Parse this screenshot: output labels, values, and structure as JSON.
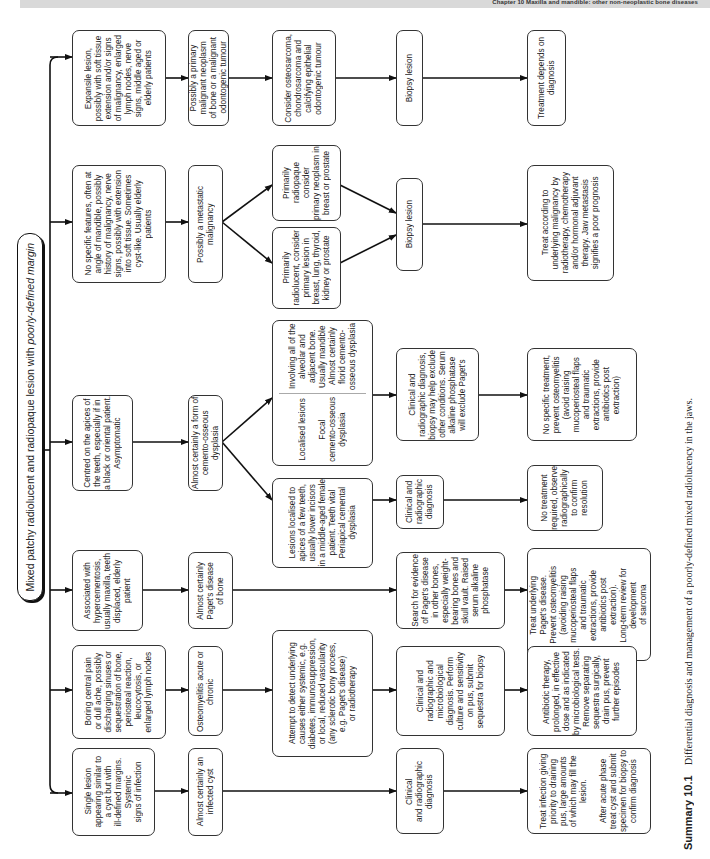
{
  "header": {
    "running_title": "Chapter 10 Maxilla and mandible: other non-neoplastic bone diseases"
  },
  "root": {
    "label_plain": "Mixed patchy radiolucent and radiopaque lesion with ",
    "label_italic": "poorly-defined margin"
  },
  "columns": [
    {
      "presentation": "Single lesion\nappearing similar to\na cyst but with\nill-defined margins.\nSystemic\nsigns of infection",
      "diagnosis": "Almost certainly an\ninfected cyst",
      "investigation": "Clinical\nand radiographic\ndiagnosis",
      "management": "Treat infection giving\npriority to draining\npus, large amounts\nof which may fill the\nlesion.\n\nAfter acute phase\ntreat cyst and submit\nspecimen for biopsy to\nconfirm diagnosis"
    },
    {
      "presentation": "Boring central pain\nor dull ache, possibly\ndischarging sinuses or\nsequestration of bone,\nperiosteal reaction,\nleucocytosis, or\nenlarged lymph nodes",
      "diagnosis": "Osteomyelitis acute or\nchronic",
      "shared_step": "Attempt to detect underlying\ncauses either systemic, e.g.\ndiabetes, immunosuppression,\nor local, reduced vascularity\n(any sclerotic bony process,\ne.g. Paget's disease)\nor radiotherapy",
      "investigation": "Clinical and\nradiographic and\nmicrobiological\ndiagnosis. Perform\nculture and sensitivity\non pus, submit\nsequestra for biopsy",
      "management": "Antibiotic therapy,\nprolonged, in effective\ndose and as indicated\nby microbiological tests.\nRemove separating\nsequestra surgically,\ndrain pus, prevent\nfurther episodes"
    },
    {
      "presentation": "Associated with\nhypercementosis,\nusually maxilla, teeth\ndisplaced, elderly\npatient",
      "diagnosis": "Almost certainly\nPaget's disease\nof bone",
      "investigation": "Search for evidence\nof Paget's disease\nin other bones,\nespecially weight-\nbearing bones and\nskull vault. Raised\nserum alkaline\nphosphatase",
      "management": "Treat underlying\nPaget's disease.\nPrevent osteomyelitis\n(avoiding raising\nmucoperiosteal flaps\nand traumatic\nextractions, provide\nantibiotics post\nextraction).\nLong-term review for\ndevelopment\nof sarcoma"
    },
    {
      "presentation": "Centred on the apices of\nthe teeth, especially if in\na black or oriental patient.\nAsymptomatic",
      "diagnosis": "Almost certainly a form of\ncemento-osseous dysplasia",
      "branch_periapical": {
        "text": "Lesions localised to\napices of a few teeth,\nusually lower incisors\nin a middle-aged female\npatient. Teeth vital",
        "conclusion": "Periapical cemental\ndysplasia",
        "investigation": "Clinical and\nradiographic\ndiagnosis",
        "management": "No treatment\nrequired, observe\nradiographically\nto confirm\nresolution"
      },
      "branch_focal_florid": {
        "focal_text": "Localised lesions",
        "focal_conclusion": "Focal\ncemento-osseous\ndysplasia",
        "florid_text": "Involving all of the\nalveolar and\nadjacent bone.\nUsually mandible",
        "florid_conclusion": "Almost certainly\nflorid cemento-\nosseous dysplasia",
        "investigation": "Clinical and\nradiographic diagnosis,\nbiopsy may help exclude\nother conditions. Serum\nalkaline phosphatase\nwill exclude Paget's",
        "management": "No specific treatment,\nprevent osteomyelitis\n(avoid raising\nmucoperiosteal flaps\nand traumatic\nextractions, provide\nantibiotics post\nextraction)"
      }
    },
    {
      "presentation": "No specific features, often at\nangle of mandible, possibly\nhistory of malignancy, nerve\nsigns, possibly with extension\ninto soft tissue. Sometimes\ncyst-like. Usually elderly\npatients",
      "diagnosis": "Possibly a metastatic\nmalignancy",
      "branch_radiopaque": "Primarily\nradiopaque consider\nprimary neoplasm in\nbreast or prostate",
      "branch_radiolucent": "Primarily\nradiolucent, consider\nprimary lesion in\nbreast, lung, thyroid,\nkidney or prostate",
      "investigation": "Biopsy lesion",
      "management": "Treat according to\nunderlying malignancy by\nradiotherapy, chemotherapy\nand/or hormonal adjuvant\ntherapy. Jaw metastasis\nsignifies a poor prognosis"
    },
    {
      "presentation": "Expansile lesion,\npossibly with soft tissue\nextension and/or signs\nof malignancy, enlarged\nlymph nodes, nerve\nsigns, middle aged or\nelderly patients",
      "diagnosis": "Possibly a primary\nmalignant neoplasm\nof bone or a malignant\nodontogenic tumour",
      "consider": "Consider osteosarcoma,\nchondrosarcoma and\ncalcifying epithelial\nodontogenic tumour",
      "investigation": "Biopsy lesion",
      "management": "Treatment depends on\ndiagnosis"
    }
  ],
  "caption": {
    "number": "Summary 10.1",
    "text": "Differential diagnosis and management of a poorly-defined mixed radiolucency in the jaws."
  }
}
